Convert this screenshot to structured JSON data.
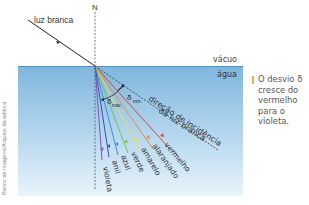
{
  "labels": {
    "incident": "luz branca",
    "normal": "N",
    "vacuum": "vácuo",
    "water": "água",
    "incidence_direction_line1": "direção de incidência",
    "incidence_direction_line2": "da luz branca",
    "delta_max": "δ",
    "delta_max_sub": "máx.",
    "delta_min": "δ",
    "delta_min_sub": "mín."
  },
  "rays": [
    {
      "name": "vermelho",
      "color": "#e0443a"
    },
    {
      "name": "alaranjado",
      "color": "#f08a3c"
    },
    {
      "name": "amarelo",
      "color": "#f2e04a"
    },
    {
      "name": "verde",
      "color": "#7cc24a"
    },
    {
      "name": "azul",
      "color": "#3a8fd8"
    },
    {
      "name": "anil",
      "color": "#3a4fb0"
    },
    {
      "name": "violeta",
      "color": "#8a4fb8"
    }
  ],
  "note": "O desvio δ cresce do vermelho para o violeta.",
  "credit": "Banco de imagens/Arquivo da editora",
  "colors": {
    "water_top": "#7fb6dd",
    "water_bottom": "#e4f2fb",
    "accent": "#f0b43c"
  }
}
